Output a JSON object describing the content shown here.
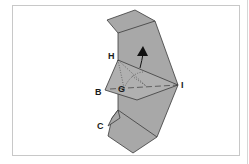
{
  "diagram": {
    "type": "folding-diagram",
    "colors": {
      "paper": "#a6a6a6",
      "paper_light": "#b3b3b3",
      "edge": "#3a3a3a",
      "frame": "#c8c8c8"
    },
    "labels": {
      "H": "H",
      "I": "I",
      "B": "B",
      "G": "G",
      "C": "C"
    },
    "arrow": {
      "direction": "up",
      "meaning": "fold-direction"
    }
  }
}
